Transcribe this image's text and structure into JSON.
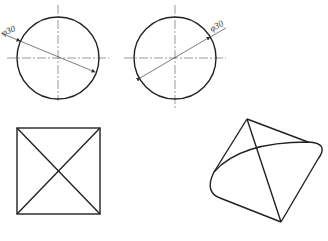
{
  "figures": {
    "circle_left": {
      "dimension_label": "φ30",
      "cx": 58,
      "cy": 58,
      "r": 41
    },
    "circle_right": {
      "dimension_label": "φ30",
      "cx": 175,
      "cy": 58,
      "r": 41
    },
    "square": {
      "x1": 17,
      "y1": 128,
      "x2": 100,
      "y2": 214
    },
    "curved_shape": {
      "apex": [
        247,
        119
      ],
      "right": [
        322,
        143
      ],
      "bottom": [
        281,
        222
      ],
      "left": [
        212,
        172
      ]
    }
  }
}
